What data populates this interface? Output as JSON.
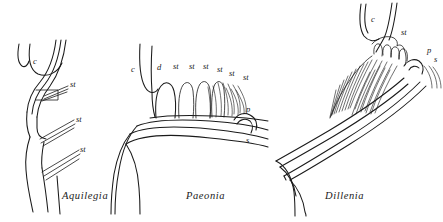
{
  "figure": {
    "background_color": "#ffffff",
    "ink_color": "#1a1a1a",
    "width": 443,
    "height": 222
  },
  "panels": [
    {
      "id": "aquilegia",
      "caption": "Aquilegia",
      "caption_x": 62,
      "caption_y": 199,
      "labels": [
        {
          "text": "c",
          "x": 33,
          "y": 64
        },
        {
          "text": "st",
          "x": 70,
          "y": 87
        },
        {
          "text": "st",
          "x": 76,
          "y": 122
        },
        {
          "text": "st",
          "x": 80,
          "y": 152
        }
      ]
    },
    {
      "id": "paeonia",
      "caption": "Paeonia",
      "caption_x": 186,
      "caption_y": 199,
      "labels": [
        {
          "text": "c",
          "x": 131,
          "y": 72
        },
        {
          "text": "d",
          "x": 157,
          "y": 70
        },
        {
          "text": "st",
          "x": 173,
          "y": 69
        },
        {
          "text": "st",
          "x": 189,
          "y": 69
        },
        {
          "text": "st",
          "x": 203,
          "y": 69
        },
        {
          "text": "st",
          "x": 217,
          "y": 72
        },
        {
          "text": "st",
          "x": 229,
          "y": 76
        },
        {
          "text": "st",
          "x": 243,
          "y": 80
        },
        {
          "text": "p",
          "x": 246,
          "y": 112
        },
        {
          "text": "s",
          "x": 246,
          "y": 143
        }
      ]
    },
    {
      "id": "dillenia",
      "caption": "Dillenia",
      "caption_x": 325,
      "caption_y": 199,
      "labels": [
        {
          "text": "c",
          "x": 371,
          "y": 22
        },
        {
          "text": "st",
          "x": 401,
          "y": 35
        },
        {
          "text": "p",
          "x": 427,
          "y": 53
        },
        {
          "text": "s",
          "x": 434,
          "y": 62
        }
      ]
    }
  ],
  "legend_keys": [
    {
      "abbr": "c",
      "meaning": "calyx"
    },
    {
      "abbr": "d",
      "meaning": "disc"
    },
    {
      "abbr": "st",
      "meaning": "stamen"
    },
    {
      "abbr": "p",
      "meaning": "petal"
    },
    {
      "abbr": "s",
      "meaning": "sepal"
    }
  ]
}
